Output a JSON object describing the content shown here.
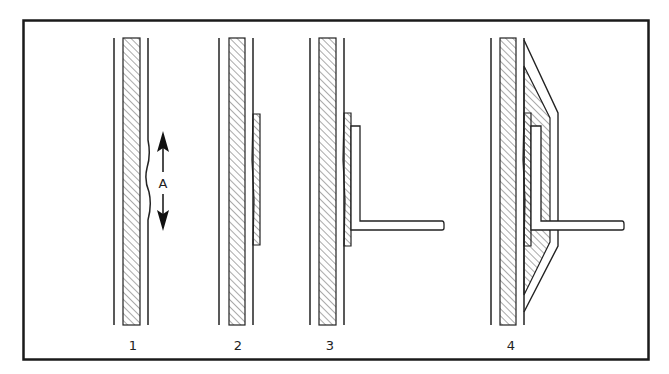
{
  "figure": {
    "frame_color": "#1a1a1a",
    "line_color": "#222222",
    "hatch_color": "#555555",
    "background": "#ffffff"
  },
  "panels": [
    {
      "id": 1,
      "label": "1",
      "description": "Wall with surface defect (wavy outer surface)"
    },
    {
      "id": 2,
      "label": "2",
      "description": "Patch plate applied over defect"
    },
    {
      "id": 3,
      "label": "3",
      "description": "L-bracket attached to patched wall"
    },
    {
      "id": 4,
      "label": "4",
      "description": "Bracket encased in tapered hatched housing"
    }
  ],
  "annotations": {
    "arrow_label": "A"
  }
}
